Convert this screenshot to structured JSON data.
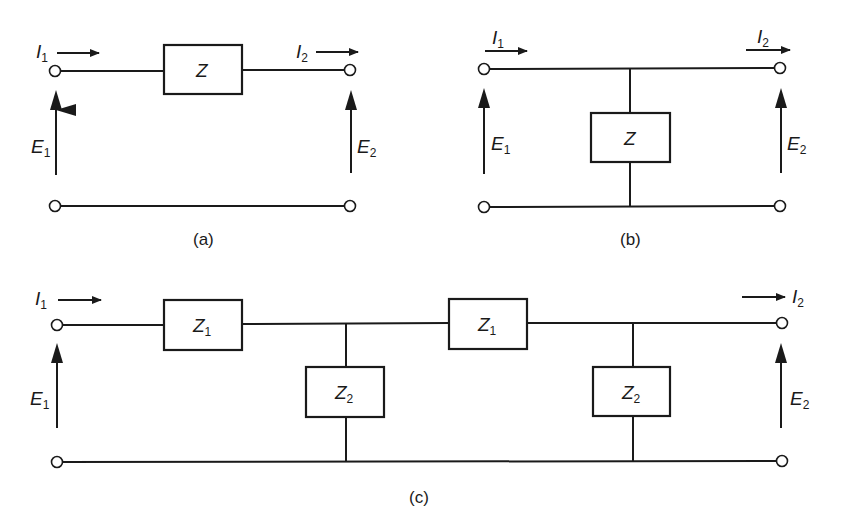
{
  "figure": {
    "panels": [
      {
        "id": "a",
        "caption": "(a)",
        "description": "Series impedance two-port",
        "elements": [
          {
            "label": "Z",
            "subscript": "",
            "placement": "series"
          }
        ],
        "labels": {
          "i_in": {
            "main": "I",
            "sub": "1"
          },
          "i_out": {
            "main": "I",
            "sub": "2"
          },
          "e_in": {
            "main": "E",
            "sub": "1"
          },
          "e_out": {
            "main": "E",
            "sub": "2"
          }
        }
      },
      {
        "id": "b",
        "caption": "(b)",
        "description": "Shunt impedance two-port",
        "elements": [
          {
            "label": "Z",
            "subscript": "",
            "placement": "shunt"
          }
        ],
        "labels": {
          "i_in": {
            "main": "I",
            "sub": "1"
          },
          "i_out": {
            "main": "I",
            "sub": "2"
          },
          "e_in": {
            "main": "E",
            "sub": "1"
          },
          "e_out": {
            "main": "E",
            "sub": "2"
          }
        }
      },
      {
        "id": "c",
        "caption": "(c)",
        "description": "Ladder network of two L-sections",
        "elements": [
          {
            "label": "Z",
            "subscript": "1",
            "placement": "series"
          },
          {
            "label": "Z",
            "subscript": "2",
            "placement": "shunt"
          },
          {
            "label": "Z",
            "subscript": "1",
            "placement": "series"
          },
          {
            "label": "Z",
            "subscript": "2",
            "placement": "shunt"
          }
        ],
        "labels": {
          "i_in": {
            "main": "I",
            "sub": "1"
          },
          "i_out": {
            "main": "I",
            "sub": "2"
          },
          "e_in": {
            "main": "E",
            "sub": "1"
          },
          "e_out": {
            "main": "E",
            "sub": "2"
          }
        }
      }
    ]
  }
}
